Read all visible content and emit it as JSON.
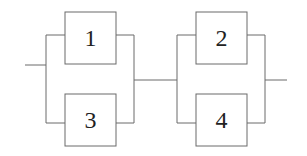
{
  "diagram": {
    "type": "reliability-block-diagram",
    "blocks": [
      {
        "id": "b1",
        "label": "1",
        "group": "left",
        "position": "top"
      },
      {
        "id": "b3",
        "label": "3",
        "group": "left",
        "position": "bottom"
      },
      {
        "id": "b2",
        "label": "2",
        "group": "right",
        "position": "top"
      },
      {
        "id": "b4",
        "label": "4",
        "group": "right",
        "position": "bottom"
      }
    ],
    "connections": [
      {
        "from": "input",
        "to": "left-parallel"
      },
      {
        "from": "left-parallel",
        "to": "right-parallel"
      },
      {
        "from": "right-parallel",
        "to": "output"
      }
    ],
    "colors": {
      "line": "#6a6a6a",
      "text": "#222222",
      "background": "#ffffff"
    }
  }
}
